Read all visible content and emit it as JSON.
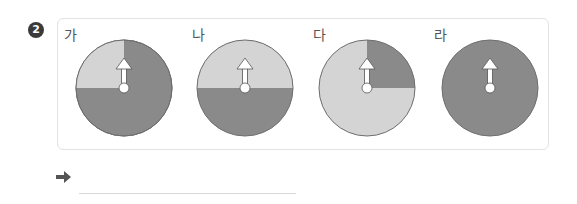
{
  "problem": {
    "number": "2",
    "spinners": [
      {
        "label": "가",
        "light_fraction": 0.25,
        "light_start_deg": 270,
        "light_end_deg": 360,
        "description": "light gray top-left quarter, dark gray three quarters"
      },
      {
        "label": "나",
        "light_fraction": 0.5,
        "light_start_deg": 270,
        "light_end_deg": 450,
        "description": "light gray top half, dark gray bottom half"
      },
      {
        "label": "다",
        "light_fraction": 0.75,
        "light_start_deg": 90,
        "light_end_deg": 360,
        "description": "dark gray top-right quarter, light gray three quarters"
      },
      {
        "label": "라",
        "light_fraction": 0,
        "description": "all dark gray"
      }
    ],
    "colors": {
      "light": "#d4d4d4",
      "dark": "#8a8a8a",
      "outline": "#6e6e6e",
      "pointer": "#ffffff",
      "badge": "#3a3a3a"
    },
    "answer": {
      "arrow_icon": "right-arrow-icon",
      "value": ""
    }
  }
}
